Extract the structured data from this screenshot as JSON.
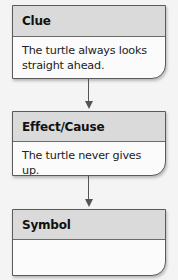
{
  "diagram": {
    "type": "flowchart",
    "boxes": [
      {
        "header": "Clue",
        "body": "The turtle always looks straight ahead."
      },
      {
        "header": "Effect/Cause",
        "body": "The turtle never gives up."
      },
      {
        "header": "Symbol",
        "body": ""
      }
    ],
    "connectors": [
      {
        "from": 0,
        "to": 1,
        "direction": "down"
      },
      {
        "from": 1,
        "to": 2,
        "direction": "down"
      }
    ],
    "colors": {
      "header_bg": "#dadada",
      "body_bg": "#fbfbfb",
      "border": "#5a5a5a",
      "arrow": "#555555"
    }
  }
}
